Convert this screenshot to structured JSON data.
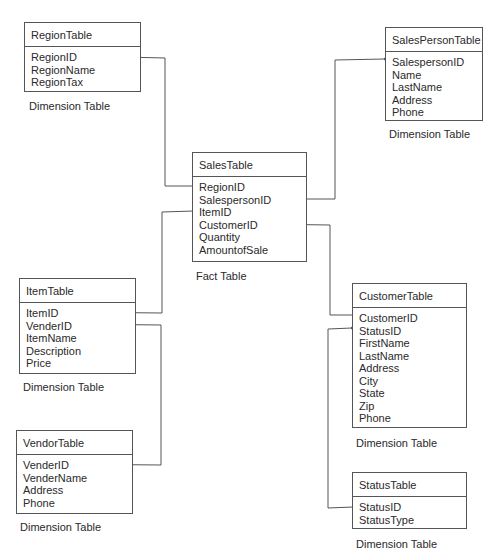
{
  "tables": {
    "region": {
      "title": "RegionTable",
      "fields": [
        "RegionID",
        "RegionName",
        "RegionTax"
      ],
      "caption": "Dimension Table"
    },
    "salesperson": {
      "title": "SalesPersonTable",
      "fields": [
        "SalespersonID",
        "Name",
        "LastName",
        "Address",
        "Phone"
      ],
      "caption": "Dimension Table"
    },
    "sales": {
      "title": "SalesTable",
      "fields": [
        "RegionID",
        "SalespersonID",
        "ItemID",
        "CustomerID",
        "Quantity",
        "AmountofSale"
      ],
      "caption": "Fact Table"
    },
    "item": {
      "title": "ItemTable",
      "fields": [
        "ItemID",
        "VenderID",
        "ItemName",
        "Description",
        "Price"
      ],
      "caption": "Dimension Table"
    },
    "vendor": {
      "title": "VendorTable",
      "fields": [
        "VenderID",
        "VenderName",
        "Address",
        "Phone"
      ],
      "caption": "Dimension Table"
    },
    "customer": {
      "title": "CustomerTable",
      "fields": [
        "CustomerID",
        "StatusID",
        "FirstName",
        "LastName",
        "Address",
        "City",
        "State",
        "Zip",
        "Phone"
      ],
      "caption": "Dimension Table"
    },
    "status": {
      "title": "StatusTable",
      "fields": [
        "StatusID",
        "StatusType"
      ],
      "caption": "Dimension Table"
    }
  },
  "relationships": [
    {
      "from": "RegionTable.RegionID",
      "to": "SalesTable.RegionID"
    },
    {
      "from": "SalesTable.SalespersonID",
      "to": "SalesPersonTable.SalespersonID"
    },
    {
      "from": "ItemTable.ItemID",
      "to": "SalesTable.ItemID"
    },
    {
      "from": "SalesTable.CustomerID",
      "to": "CustomerTable.CustomerID"
    },
    {
      "from": "ItemTable.VenderID",
      "to": "VendorTable.VenderID"
    },
    {
      "from": "CustomerTable.StatusID",
      "to": "StatusTable.StatusID"
    }
  ],
  "colors": {
    "line": "#555555",
    "text": "#2a2a2a",
    "background": "#ffffff"
  }
}
